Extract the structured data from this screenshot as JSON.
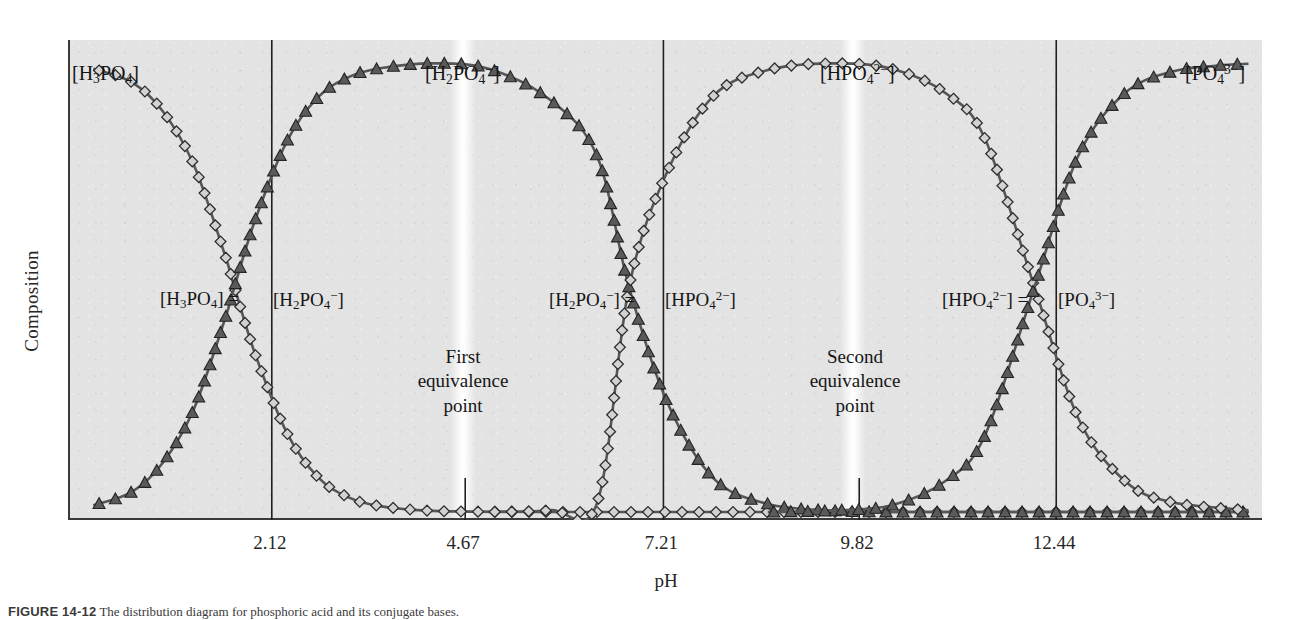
{
  "figure": {
    "caption_bold": "FIGURE 14-12",
    "caption_text": "The distribution diagram for phosphoric acid and its conjugate bases.",
    "ylabel": "Composition",
    "xlabel": "pH",
    "plot_background_color": "#e3e3e3",
    "axis_color": "#3a3a3a",
    "curve_color": "#55555a",
    "marker_diamond_color": "#d2d2d2",
    "marker_triangle_color": "#5a5a5a"
  },
  "axis": {
    "x_ticks": [
      {
        "value": "2.12",
        "kind": "pKa",
        "x_frac": 0.169
      },
      {
        "value": "4.67",
        "kind": "equivalence",
        "x_frac": 0.331
      },
      {
        "value": "7.21",
        "kind": "pKa",
        "x_frac": 0.497
      },
      {
        "value": "9.82",
        "kind": "equivalence",
        "x_frac": 0.661
      },
      {
        "value": "12.44",
        "kind": "pKa",
        "x_frac": 0.826
      }
    ]
  },
  "species": [
    {
      "name": "H3PO4",
      "label_html": "[H<sub>3</sub>PO<sub>4</sub>]",
      "marker": "diamond",
      "label_x": 72,
      "label_y": 62
    },
    {
      "name": "H2PO4-",
      "label_html": "[H<sub>2</sub>PO<sub>4</sub><sup>−</sup>]",
      "marker": "triangle",
      "label_x": 425,
      "label_y": 62
    },
    {
      "name": "HPO42-",
      "label_html": "[HPO<sub>4</sub><sup>2−</sup>]",
      "marker": "diamond",
      "label_x": 820,
      "label_y": 62
    },
    {
      "name": "PO43-",
      "label_html": "[PO<sub>4</sub><sup>3−</sup>]",
      "marker": "triangle",
      "label_x": 1185,
      "label_y": 62
    }
  ],
  "crossing_labels": [
    {
      "left_html": "[H<sub>3</sub>PO<sub>4</sub>] =",
      "right_html": "[H<sub>2</sub>PO<sub>4</sub><sup>−</sup>]",
      "left_x": 160,
      "right_x": 273,
      "y": 288
    },
    {
      "left_html": "[H<sub>2</sub>PO<sub>4</sub><sup>−</sup>] =",
      "right_html": "[HPO<sub>4</sub><sup>2−</sup>]",
      "left_x": 549,
      "right_x": 665,
      "y": 288
    },
    {
      "left_html": "[HPO<sub>4</sub><sup>2−</sup>] =",
      "right_html": "[PO<sub>4</sub><sup>3−</sup>]",
      "left_x": 942,
      "right_x": 1058,
      "y": 288
    }
  ],
  "equivalence_points": [
    {
      "lines": [
        "First",
        "equivalence",
        "point"
      ],
      "center_x": 463,
      "y": 345
    },
    {
      "lines": [
        "Second",
        "equivalence",
        "point"
      ],
      "center_x": 855,
      "y": 345
    }
  ],
  "chart_data": {
    "type": "line",
    "title": "Distribution diagram for phosphoric acid",
    "xlabel": "pH",
    "ylabel": "Composition",
    "xlim": [
      0,
      15.4
    ],
    "ylim": [
      0,
      1
    ],
    "grid": false,
    "legend": "inline species labels on curves",
    "pKa_values": [
      2.12,
      7.21,
      12.44
    ],
    "equivalence_points": [
      4.67,
      9.82
    ],
    "annotations": [
      "[H3PO4] = [H2PO4-] at pH 2.12",
      "[H2PO4-] = [HPO42-] at pH 7.21",
      "[HPO42-] = [PO43-] at pH 12.44",
      "First equivalence point at pH 4.67",
      "Second equivalence point at pH 9.82"
    ],
    "series": [
      {
        "name": "[H3PO4]",
        "marker": "diamond",
        "x": [
          0.3,
          0.8,
          1.2,
          1.6,
          2.0,
          2.12,
          2.4,
          2.8,
          3.2,
          3.6,
          4.0,
          4.6,
          5.2,
          6.0,
          7.0,
          8.0,
          10.0,
          12.0,
          14.0,
          15.2
        ],
        "y": [
          0.985,
          0.955,
          0.89,
          0.77,
          0.57,
          0.5,
          0.345,
          0.175,
          0.077,
          0.032,
          0.013,
          0.003,
          0.001,
          0.0,
          0.0,
          0.0,
          0.0,
          0.0,
          0.0,
          0.0
        ]
      },
      {
        "name": "[H2PO4-]",
        "marker": "triangle",
        "x": [
          0.3,
          0.8,
          1.2,
          1.6,
          2.0,
          2.12,
          2.4,
          2.8,
          3.2,
          3.6,
          4.0,
          4.67,
          5.4,
          6.2,
          6.8,
          7.21,
          7.7,
          8.3,
          9.0,
          9.82,
          10.6,
          11.5,
          12.44,
          13.5,
          15.2
        ],
        "y": [
          0.015,
          0.045,
          0.11,
          0.23,
          0.43,
          0.5,
          0.655,
          0.825,
          0.922,
          0.967,
          0.986,
          0.997,
          0.985,
          0.915,
          0.79,
          0.5,
          0.245,
          0.075,
          0.018,
          0.003,
          0.0,
          0.0,
          0.0,
          0.0,
          0.0
        ]
      },
      {
        "name": "[HPO42-]",
        "marker": "diamond",
        "x": [
          5.4,
          6.2,
          6.8,
          7.21,
          7.7,
          8.3,
          9.0,
          9.82,
          10.6,
          11.3,
          11.8,
          12.44,
          13.0,
          13.6,
          14.2,
          15.2
        ],
        "y": [
          0.0,
          0.004,
          0.021,
          0.5,
          0.755,
          0.925,
          0.982,
          0.997,
          0.985,
          0.93,
          0.83,
          0.5,
          0.21,
          0.07,
          0.022,
          0.004
        ]
      },
      {
        "name": "[PO43-]",
        "marker": "triangle",
        "x": [
          9.0,
          9.82,
          10.6,
          11.3,
          11.8,
          12.44,
          13.0,
          13.6,
          14.2,
          14.8,
          15.2
        ],
        "y": [
          0.0,
          0.003,
          0.015,
          0.07,
          0.17,
          0.5,
          0.79,
          0.93,
          0.978,
          0.992,
          0.996
        ]
      }
    ]
  }
}
